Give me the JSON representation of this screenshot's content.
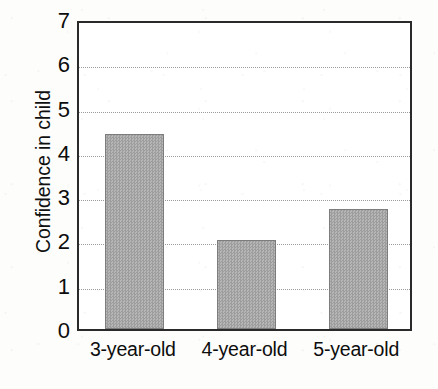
{
  "chart_data": {
    "type": "bar",
    "title": "",
    "subtitle": "",
    "xlabel": "",
    "ylabel": "Confidence in child",
    "categories": [
      "3-year-old",
      "4-year-old",
      "5-year-old"
    ],
    "values": [
      4.4,
      2.0,
      2.7
    ],
    "ylim": [
      0,
      7
    ],
    "ytick_labels": [
      "0",
      "1",
      "2",
      "3",
      "4",
      "5",
      "6",
      "7"
    ],
    "ytick_values": [
      0,
      1,
      2,
      3,
      4,
      5,
      6,
      7
    ],
    "ytick_step": 1,
    "gridlines": {
      "visible": true,
      "axis": "y",
      "style": "dotted",
      "at_values": [
        1,
        2,
        3,
        4,
        5,
        6
      ],
      "color": "#9a9a9a"
    },
    "legend": {
      "visible": false,
      "position": "none",
      "entries": []
    },
    "annotations": [],
    "series": [
      {
        "name": "Confidence in child",
        "values": [
          4.4,
          2.0,
          2.7
        ],
        "bar_fill_color": "#a9a9a9",
        "bar_edge_color": "#7d7d7d",
        "bar_fill_pattern": "dithered-gray-checker"
      }
    ],
    "colors": {
      "axis": "#2a2a2a",
      "text": "#0d0d0d",
      "grid": "#9a9a9a",
      "plot_background": "#ffffff",
      "page_background": "#fdfdfc",
      "bar": "#a9a9a9"
    }
  }
}
